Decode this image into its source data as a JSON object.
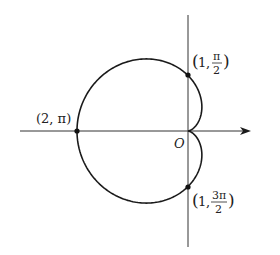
{
  "diagram": {
    "type": "polar-curve",
    "curve": "cardioid r = 1 - cos θ",
    "origin_label": "O",
    "points": [
      {
        "label_r": "1",
        "label_theta_num": "π",
        "label_theta_den": "2",
        "r": 1,
        "theta": "π/2"
      },
      {
        "label": "(2, π)",
        "r": 2,
        "theta": "π"
      },
      {
        "label_r": "1",
        "label_theta_num": "3π",
        "label_theta_den": "2",
        "r": 1,
        "theta": "3π/2"
      }
    ],
    "colors": {
      "stroke": "#1a1a1a",
      "background": "#ffffff"
    }
  }
}
